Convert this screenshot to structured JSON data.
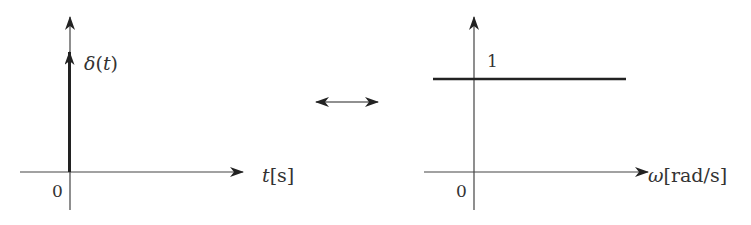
{
  "left_plot": {
    "signal_label": "δ(t)",
    "x_axis_label_var": "t",
    "x_axis_label_unit": "[s]",
    "origin_label": "0"
  },
  "transform_symbol": "↔",
  "right_plot": {
    "level_label": "1",
    "x_axis_label_var": "ω",
    "x_axis_label_unit": "[rad/s]",
    "origin_label": "0"
  },
  "colors": {
    "axis": "#444444",
    "signal": "#222222"
  }
}
